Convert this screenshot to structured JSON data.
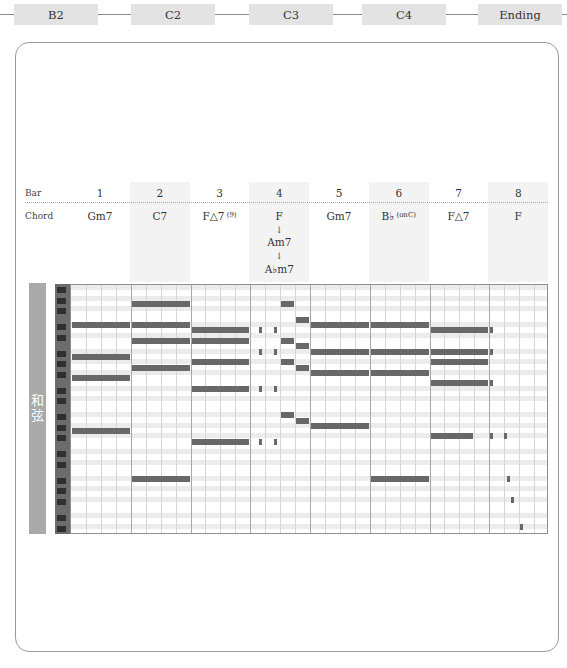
{
  "sections": [
    {
      "label": "B2",
      "x": 14,
      "w": 84
    },
    {
      "label": "C2",
      "x": 131,
      "w": 84
    },
    {
      "label": "C3",
      "x": 249,
      "w": 84
    },
    {
      "label": "C4",
      "x": 362,
      "w": 84
    },
    {
      "label": "Ending",
      "x": 478,
      "w": 84
    }
  ],
  "header": {
    "bar_label": "Bar",
    "chord_label": "Chord"
  },
  "bars": [
    {
      "num": "1",
      "chord": "Gm7"
    },
    {
      "num": "2",
      "chord": "C7"
    },
    {
      "num": "3",
      "chord": "F△7",
      "chord_sup": "(9)"
    },
    {
      "num": "4",
      "chord": "F",
      "arrow1": "↓",
      "chord2": "Am7",
      "arrow2": "↓",
      "chord3": "A♭m7"
    },
    {
      "num": "5",
      "chord": "Gm7"
    },
    {
      "num": "6",
      "chord": "B♭",
      "chord_sup": "(onC)"
    },
    {
      "num": "7",
      "chord": "F△7"
    },
    {
      "num": "8",
      "chord": "F"
    }
  ],
  "side_label": {
    "line1": "和",
    "line2": "弦"
  },
  "colors": {
    "note": "#686868",
    "shade": "#f3f3f3",
    "side": "#a9a9a9",
    "section_bg": "#e3e3e3"
  },
  "chart_data": {
    "type": "piano-roll",
    "bars": 8,
    "beats_per_bar": 4,
    "notes": [
      {
        "bar": 1,
        "start": 0,
        "len": 4,
        "row": 7,
        "label": "Gm7 top"
      },
      {
        "bar": 1,
        "start": 0,
        "len": 4,
        "row": 13
      },
      {
        "bar": 1,
        "start": 0,
        "len": 4,
        "row": 17
      },
      {
        "bar": 1,
        "start": 0,
        "len": 4,
        "row": 27
      },
      {
        "bar": 2,
        "start": 0,
        "len": 4,
        "row": 3
      },
      {
        "bar": 2,
        "start": 0,
        "len": 4,
        "row": 7
      },
      {
        "bar": 2,
        "start": 0,
        "len": 4,
        "row": 10
      },
      {
        "bar": 2,
        "start": 0,
        "len": 4,
        "row": 15
      },
      {
        "bar": 2,
        "start": 0,
        "len": 4,
        "row": 36
      },
      {
        "bar": 3,
        "start": 0,
        "len": 4,
        "row": 8
      },
      {
        "bar": 3,
        "start": 0,
        "len": 4,
        "row": 10
      },
      {
        "bar": 3,
        "start": 0,
        "len": 4,
        "row": 14
      },
      {
        "bar": 3,
        "start": 0,
        "len": 4,
        "row": 19
      },
      {
        "bar": 3,
        "start": 0,
        "len": 4,
        "row": 29
      },
      {
        "bar": 4,
        "start": 0.5,
        "len": 0.3,
        "row": 8
      },
      {
        "bar": 4,
        "start": 1.5,
        "len": 0.3,
        "row": 8
      },
      {
        "bar": 4,
        "start": 0.5,
        "len": 0.3,
        "row": 12
      },
      {
        "bar": 4,
        "start": 1.5,
        "len": 0.3,
        "row": 12
      },
      {
        "bar": 4,
        "start": 0.5,
        "len": 0.3,
        "row": 19
      },
      {
        "bar": 4,
        "start": 1.5,
        "len": 0.3,
        "row": 19
      },
      {
        "bar": 4,
        "start": 0.5,
        "len": 0.3,
        "row": 29
      },
      {
        "bar": 4,
        "start": 1.5,
        "len": 0.3,
        "row": 29
      },
      {
        "bar": 4,
        "start": 2,
        "len": 1,
        "row": 3
      },
      {
        "bar": 4,
        "start": 2,
        "len": 1,
        "row": 10
      },
      {
        "bar": 4,
        "start": 2,
        "len": 1,
        "row": 14
      },
      {
        "bar": 4,
        "start": 2,
        "len": 1,
        "row": 24
      },
      {
        "bar": 4,
        "start": 3,
        "len": 1,
        "row": 6
      },
      {
        "bar": 4,
        "start": 3,
        "len": 1,
        "row": 11
      },
      {
        "bar": 4,
        "start": 3,
        "len": 1,
        "row": 15
      },
      {
        "bar": 4,
        "start": 3,
        "len": 1,
        "row": 25
      },
      {
        "bar": 5,
        "start": 0,
        "len": 4,
        "row": 7
      },
      {
        "bar": 5,
        "start": 0,
        "len": 4,
        "row": 12
      },
      {
        "bar": 5,
        "start": 0,
        "len": 4,
        "row": 16
      },
      {
        "bar": 5,
        "start": 0,
        "len": 4,
        "row": 26
      },
      {
        "bar": 6,
        "start": 0,
        "len": 4,
        "row": 7
      },
      {
        "bar": 6,
        "start": 0,
        "len": 4,
        "row": 12
      },
      {
        "bar": 6,
        "start": 0,
        "len": 4,
        "row": 16
      },
      {
        "bar": 6,
        "start": 0,
        "len": 4,
        "row": 36
      },
      {
        "bar": 7,
        "start": 0,
        "len": 4,
        "row": 8
      },
      {
        "bar": 7,
        "start": 0,
        "len": 4,
        "row": 12
      },
      {
        "bar": 7,
        "start": 0,
        "len": 4,
        "row": 14
      },
      {
        "bar": 7,
        "start": 0,
        "len": 4,
        "row": 18
      },
      {
        "bar": 7,
        "start": 0,
        "len": 3,
        "row": 28
      },
      {
        "bar": 8,
        "start": 0,
        "len": 0.2,
        "row": 8
      },
      {
        "bar": 8,
        "start": 0,
        "len": 0.2,
        "row": 12
      },
      {
        "bar": 8,
        "start": 0,
        "len": 0.2,
        "row": 18
      },
      {
        "bar": 8,
        "start": 0,
        "len": 0.2,
        "row": 28
      },
      {
        "bar": 8,
        "start": 0.9,
        "len": 0.2,
        "row": 28
      },
      {
        "bar": 8,
        "start": 1.1,
        "len": 0.1,
        "row": 36
      },
      {
        "bar": 8,
        "start": 1.4,
        "len": 0.1,
        "row": 40
      },
      {
        "bar": 8,
        "start": 2,
        "len": 0.2,
        "row": 45
      }
    ]
  }
}
